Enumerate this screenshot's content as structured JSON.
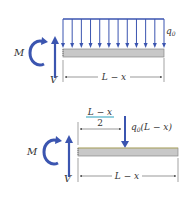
{
  "diagram": {
    "top": {
      "moment_label": "M",
      "shear_label": "V",
      "load_label": "q",
      "load_subscript": "0",
      "length_label": "L − x",
      "arrow_count": 12
    },
    "bottom": {
      "moment_label": "M",
      "shear_label": "V",
      "fraction_numerator": "L − x",
      "fraction_denominator": "2",
      "resultant_label_q": "q",
      "resultant_label_sub": "0",
      "resultant_label_rest": "(L − x)",
      "length_label": "L − x"
    },
    "colors": {
      "force": "#3b55b0",
      "beam_fill": "#c8c8c8",
      "beam_stroke": "#888888",
      "dimension": "#555555",
      "highlight": "#4ab0c8"
    }
  }
}
